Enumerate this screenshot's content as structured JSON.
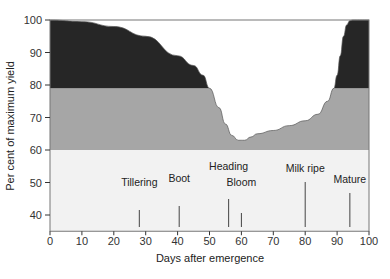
{
  "chart_data": {
    "type": "area",
    "title": "",
    "xlabel": "Days after emergence",
    "ylabel": "Per cent of maximum yield",
    "xlim": [
      0,
      100
    ],
    "ylim": [
      35,
      100
    ],
    "xticks": [
      "0",
      "10",
      "20",
      "30",
      "40",
      "50",
      "60",
      "70",
      "80",
      "90",
      "100"
    ],
    "yticks": [
      "40",
      "50",
      "60",
      "70",
      "80",
      "90",
      "100"
    ],
    "bands": [
      {
        "name": "light band",
        "from": 35,
        "to": 60,
        "color": "#f2f2f2"
      },
      {
        "name": "gray band",
        "from": 60,
        "to": 79,
        "color": "#a6a6a6"
      },
      {
        "name": "dark band",
        "from": 79,
        "to": 100,
        "color": "#262626"
      }
    ],
    "curve": {
      "x": [
        0,
        10,
        20,
        30,
        40,
        45,
        48,
        50,
        53,
        55,
        57,
        59,
        61,
        63,
        65,
        70,
        75,
        80,
        84,
        87,
        89,
        90,
        91,
        92,
        93,
        94,
        95,
        97,
        100
      ],
      "y": [
        100,
        99.5,
        98,
        95,
        89,
        86,
        83,
        79,
        73,
        68,
        64.5,
        63,
        63,
        64,
        65,
        66,
        67.5,
        69,
        71,
        75,
        79,
        83,
        89,
        95,
        98.5,
        99.8,
        100,
        100,
        100
      ]
    },
    "stages": [
      {
        "label": "Tillering",
        "x": 28
      },
      {
        "label": "Boot",
        "x": 40.5
      },
      {
        "label": "Heading",
        "x": 56
      },
      {
        "label": "Bloom",
        "x": 60
      },
      {
        "label": "Milk ripe",
        "x": 80
      },
      {
        "label": "Mature",
        "x": 94
      }
    ]
  }
}
